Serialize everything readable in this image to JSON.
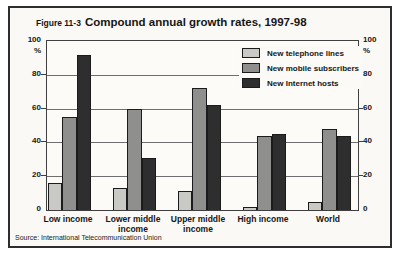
{
  "figure": {
    "label": "Figure 11-3",
    "title": "Compound annual growth rates, 1997-98",
    "source": "Source: International Telecommunication Union"
  },
  "colors": {
    "telephone_bar": "#c9cac6",
    "mobile_bar": "#8f8f8d",
    "internet_bar": "#2e2e2e",
    "figure_background": "#faf9f5",
    "gridline": "#6e6e6e"
  },
  "chart_data": {
    "type": "bar",
    "title": "Compound annual growth rates, 1997-98",
    "categories": [
      "Low income",
      "Lower middle\nincome",
      "Upper middle\nincome",
      "High income",
      "World"
    ],
    "series": [
      {
        "name": "New telephone lines",
        "color": "#c9cac6",
        "values": [
          16,
          13,
          11,
          2,
          5
        ]
      },
      {
        "name": "New mobile subscribers",
        "color": "#8f8f8d",
        "values": [
          55,
          60,
          72,
          44,
          48
        ]
      },
      {
        "name": "New Internet hosts",
        "color": "#2e2e2e",
        "values": [
          92,
          31,
          62,
          45,
          44
        ]
      }
    ],
    "xlabel": "",
    "ylabel": "%",
    "y_unit": "%",
    "ylim": [
      0,
      100
    ],
    "yticks": [
      0,
      20,
      40,
      60,
      80,
      100
    ],
    "grid": true,
    "legend_position": "top-right",
    "source": "International Telecommunication Union"
  }
}
